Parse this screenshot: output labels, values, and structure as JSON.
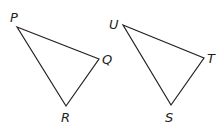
{
  "figure": {
    "triangles": [
      {
        "name": "PQR",
        "vertices": [
          {
            "label": "P",
            "x": 17,
            "y": 27,
            "lx": 10,
            "ly": 22
          },
          {
            "label": "Q",
            "x": 99,
            "y": 59,
            "lx": 102,
            "ly": 64
          },
          {
            "label": "R",
            "x": 66,
            "y": 106,
            "lx": 61,
            "ly": 122
          }
        ]
      },
      {
        "name": "UTS",
        "vertices": [
          {
            "label": "U",
            "x": 123,
            "y": 25,
            "lx": 109,
            "ly": 29
          },
          {
            "label": "T",
            "x": 204,
            "y": 58,
            "lx": 207,
            "ly": 63
          },
          {
            "label": "S",
            "x": 171,
            "y": 105,
            "lx": 165,
            "ly": 122
          }
        ]
      }
    ]
  }
}
